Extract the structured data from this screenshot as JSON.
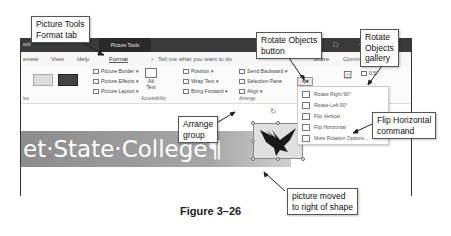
{
  "window": {
    "doc_label": "ock",
    "context_tab": "Picture Tools",
    "controls": [
      "☐",
      "–"
    ]
  },
  "tabs": [
    {
      "label": "eview"
    },
    {
      "label": "View"
    },
    {
      "label": "Help"
    },
    {
      "label": "Format",
      "active": true
    },
    {
      "label": "Tell me what you want to do"
    },
    {
      "label": "Share"
    },
    {
      "label": "Comments"
    }
  ],
  "ribbon": {
    "picture_styles": [
      "Picture Border ▾",
      "Picture Effects ▾",
      "Picture Layout ▾"
    ],
    "alt_text": [
      "Alt",
      "Text"
    ],
    "accessibility_group": "Accessibility",
    "arrange": {
      "col1": [
        "Position ▾",
        "Wrap Text ▾",
        "Bring Forward ▾"
      ],
      "col2": [
        "Send Backward ▾",
        "Selection Pane",
        "Align ▾"
      ],
      "group_label": "Arrange"
    },
    "size_value": "0.5\"",
    "crop_label": "Crop",
    "styles_group": "les"
  },
  "rotate_menu": {
    "items": [
      {
        "label": "Rotate Right 90°",
        "icon": "rotate-right-icon"
      },
      {
        "label": "Rotate Left 90°",
        "icon": "rotate-left-icon"
      },
      {
        "label": "Flip Vertical",
        "icon": "flip-vertical-icon"
      },
      {
        "label": "Flip Horizontal",
        "icon": "flip-horizontal-icon"
      },
      {
        "label": "More Rotation Options...",
        "icon": "rotation-options-icon"
      }
    ]
  },
  "document": {
    "banner_text": "et·State·College¶"
  },
  "callouts": {
    "format_tab": "Picture Tools\nFormat tab",
    "rotate_button": "Rotate Objects\nbutton",
    "rotate_gallery": "Rotate\nObjects\ngallery",
    "arrange_group": "Arrange\ngroup",
    "flip_horizontal": "Flip Horizontal\ncommand",
    "picture_moved": "picture moved\nto right of shape"
  },
  "caption": "Figure 3–26"
}
